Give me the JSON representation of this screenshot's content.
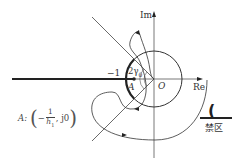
{
  "diagram": {
    "type": "nyquist-plot-with-forbidden-region",
    "axes": {
      "imag_label": "Im",
      "real_label": "Re",
      "origin_label": "O"
    },
    "labels": {
      "minus_one": "−1",
      "angle": "2γ",
      "angle_sub": "0",
      "point_a": "A"
    },
    "formula": {
      "prefix": "A:",
      "numerator": "1",
      "minus": "−",
      "denominator": "h",
      "denominator_sub": "1",
      "suffix": ", j0"
    },
    "legend": {
      "symbol": "(",
      "text": "禁区"
    },
    "colors": {
      "line": "#222222",
      "thin_line": "#444444",
      "background": "#ffffff"
    }
  }
}
